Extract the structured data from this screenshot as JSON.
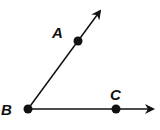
{
  "diagram": {
    "type": "angle",
    "stroke_color": "#111111",
    "background": "#ffffff",
    "points": [
      {
        "id": "A",
        "label": "A",
        "x": 78,
        "y": 41,
        "label_x": 52,
        "label_y": 38
      },
      {
        "id": "B",
        "label": "B",
        "x": 28,
        "y": 109,
        "label_x": 1,
        "label_y": 115
      },
      {
        "id": "C",
        "label": "C",
        "x": 116,
        "y": 110,
        "label_x": 110,
        "label_y": 100
      }
    ],
    "rays": [
      {
        "from": "B",
        "through": "A",
        "tip_x": 101,
        "tip_y": 9
      },
      {
        "from": "B",
        "through": "C",
        "tip_x": 155,
        "tip_y": 110
      }
    ]
  }
}
